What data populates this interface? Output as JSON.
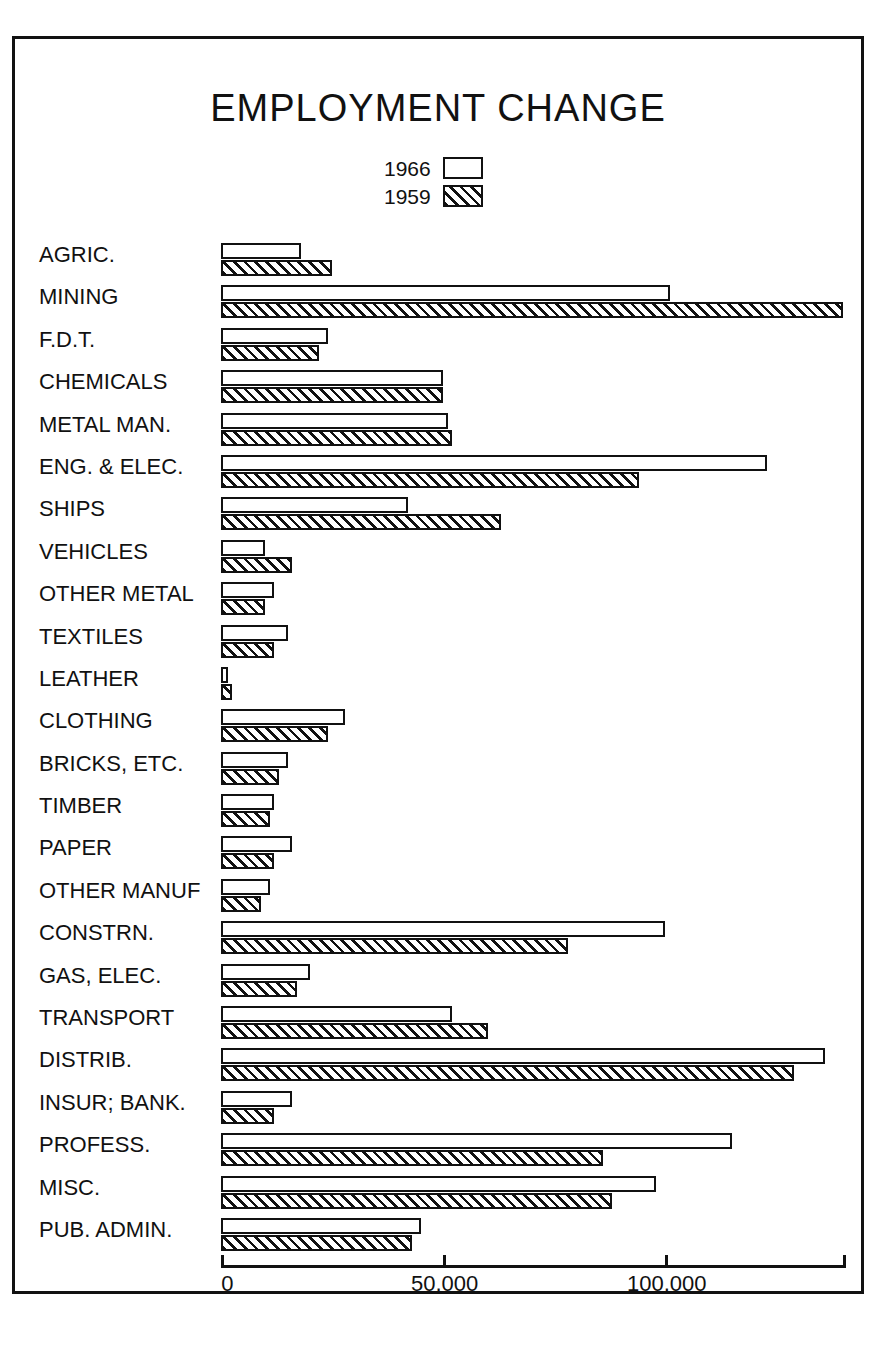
{
  "chart_data": {
    "type": "bar",
    "orientation": "horizontal",
    "title": "EMPLOYMENT CHANGE",
    "xlabel": "",
    "ylabel": "",
    "xlim": [
      0,
      140000
    ],
    "grid": false,
    "legend_position": "top-center",
    "axis_ticks": [
      {
        "value": 0,
        "label": "0"
      },
      {
        "value": 50000,
        "label": "50,000"
      },
      {
        "value": 100000,
        "label": "100,000"
      },
      {
        "value": 140000,
        "label": ""
      }
    ],
    "legend": [
      {
        "name": "1966",
        "swatch": "open"
      },
      {
        "name": "1959",
        "swatch": "hatched"
      }
    ],
    "categories": [
      "AGRIC.",
      "MINING",
      "F.D.T.",
      "CHEMICALS",
      "METAL MAN.",
      "ENG. & ELEC.",
      "SHIPS",
      "VEHICLES",
      "OTHER METAL",
      "TEXTILES",
      "LEATHER",
      "CLOTHING",
      "BRICKS, ETC.",
      "TIMBER",
      "PAPER",
      "OTHER MANUF",
      "CONSTRN.",
      "GAS, ELEC.",
      "TRANSPORT",
      "DISTRIB.",
      "INSUR; BANK.",
      "PROFESS.",
      "MISC.",
      "PUB. ADMIN."
    ],
    "series": [
      {
        "name": "1966",
        "values": [
          18000,
          101000,
          24000,
          50000,
          51000,
          123000,
          42000,
          10000,
          12000,
          15000,
          1500,
          28000,
          15000,
          12000,
          16000,
          11000,
          100000,
          20000,
          52000,
          136000,
          16000,
          115000,
          98000,
          45000
        ]
      },
      {
        "name": "1959",
        "values": [
          25000,
          140000,
          22000,
          50000,
          52000,
          94000,
          63000,
          16000,
          10000,
          12000,
          2500,
          24000,
          13000,
          11000,
          12000,
          9000,
          78000,
          17000,
          60000,
          129000,
          12000,
          86000,
          88000,
          43000
        ]
      }
    ]
  }
}
